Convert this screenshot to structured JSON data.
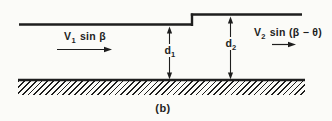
{
  "figure": {
    "caption": "(b)",
    "labels": {
      "v1": {
        "base": "V",
        "sub": "1",
        "rest": "sin β"
      },
      "v2": {
        "base": "V",
        "sub": "2",
        "rest": "sin (β − θ)"
      },
      "d1": {
        "base": "d",
        "sub": "1"
      },
      "d2": {
        "base": "d",
        "sub": "2"
      }
    },
    "icons": {
      "v1_arrow": "right-arrow",
      "v2_arrow": "right-arrow",
      "d1_arrow": "vertical-double-arrow",
      "d2_arrow": "vertical-double-arrow",
      "ground": "diagonal-hatching"
    },
    "colors": {
      "background": "#fbfbf8",
      "line": "#1e1e1e"
    }
  }
}
